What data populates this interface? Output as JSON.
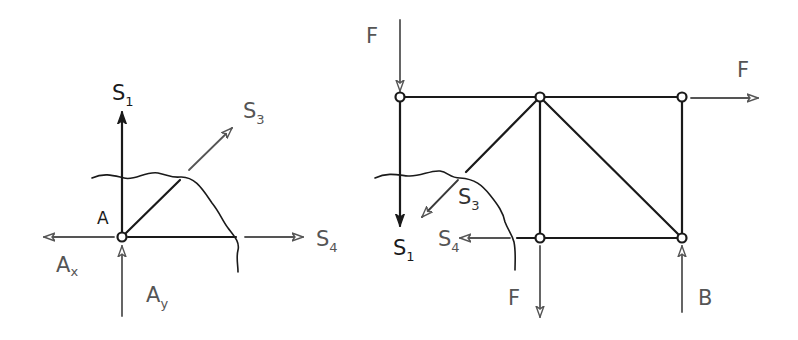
{
  "figure": {
    "colors": {
      "member": "#1a1a1a",
      "force": "#555555",
      "background": "#ffffff"
    }
  },
  "left_diagram": {
    "node_label": "A",
    "forces": {
      "s1": {
        "base": "S",
        "sub": "1"
      },
      "s3": {
        "base": "S",
        "sub": "3"
      },
      "s4": {
        "base": "S",
        "sub": "4"
      },
      "ax": {
        "base": "A",
        "sub": "x"
      },
      "ay": {
        "base": "A",
        "sub": "y"
      }
    }
  },
  "right_diagram": {
    "loads": {
      "f_top": "F",
      "f_right": "F",
      "f_bottom": "F",
      "support_b": "B"
    },
    "member_forces": {
      "s1": {
        "base": "S",
        "sub": "1"
      },
      "s3": {
        "base": "S",
        "sub": "3"
      },
      "s4": {
        "base": "S",
        "sub": "4"
      }
    }
  }
}
